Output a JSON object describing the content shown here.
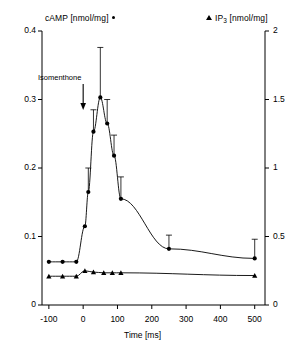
{
  "legend": {
    "left_series": "cAMP [nmol/mg]",
    "left_marker": "circle-marker",
    "right_series_prefix": "IP",
    "right_series_sub": "3",
    "right_series_suffix": " [nmol/mg]",
    "right_marker": "triangle-marker"
  },
  "annotation": {
    "label": "Isomenthone",
    "arrow": "down-arrow-icon",
    "at_time_ms": 0
  },
  "axes": {
    "x_title": "Time [ms]",
    "x_ticks": [
      "-100",
      "0",
      "100",
      "200",
      "300",
      "400",
      "500"
    ],
    "x_tick_values": [
      -100,
      0,
      100,
      200,
      300,
      400,
      500
    ],
    "y_left_ticks": [
      "0",
      "0.1",
      "0.2",
      "0.3",
      "0.4"
    ],
    "y_left_values": [
      0,
      0.1,
      0.2,
      0.3,
      0.4
    ],
    "y_right_ticks": [
      "0",
      "0.5",
      "1",
      "1.5",
      "2"
    ],
    "y_right_values": [
      0,
      0.5,
      1,
      1.5,
      2
    ]
  },
  "chart_data": {
    "type": "line",
    "title": "",
    "xlabel": "Time [ms]",
    "ylabel": "cAMP [nmol/mg]",
    "ylabel_right": "IP3 [nmol/mg]",
    "xlim": [
      -120,
      530
    ],
    "ylim": [
      0,
      0.4
    ],
    "ylim_right": [
      0,
      2
    ],
    "grid": false,
    "legend_position": "top",
    "series": [
      {
        "name": "cAMP [nmol/mg]",
        "axis": "left",
        "marker": "circle",
        "color": "#000000",
        "x": [
          -100,
          -60,
          -20,
          5,
          15,
          30,
          50,
          70,
          90,
          110,
          250,
          500
        ],
        "y": [
          0.063,
          0.063,
          0.063,
          0.115,
          0.165,
          0.253,
          0.303,
          0.265,
          0.218,
          0.155,
          0.082,
          0.068
        ],
        "yerr": [
          0,
          0,
          0,
          0,
          0.035,
          0.032,
          0.073,
          0.035,
          0.03,
          0.032,
          0.02,
          0.028
        ]
      },
      {
        "name": "IP3 [nmol/mg]",
        "axis": "right",
        "marker": "triangle",
        "color": "#000000",
        "x": [
          -100,
          -60,
          -20,
          5,
          30,
          60,
          85,
          110,
          500
        ],
        "y": [
          0.21,
          0.21,
          0.21,
          0.25,
          0.24,
          0.235,
          0.235,
          0.235,
          0.215
        ],
        "yerr": [
          0,
          0,
          0,
          0,
          0,
          0,
          0,
          0,
          0
        ]
      }
    ]
  }
}
